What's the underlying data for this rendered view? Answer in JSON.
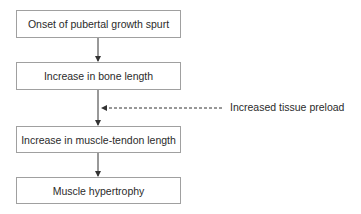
{
  "diagram": {
    "type": "flowchart",
    "nodes": [
      {
        "id": "onset",
        "label": "Onset of pubertal growth spurt"
      },
      {
        "id": "bone",
        "label": "Increase in bone length"
      },
      {
        "id": "muscle_tendon",
        "label": "Increase in muscle-tendon length"
      },
      {
        "id": "hypertrophy",
        "label": "Muscle hypertrophy"
      }
    ],
    "edges": [
      {
        "from": "onset",
        "to": "bone",
        "style": "solid"
      },
      {
        "from": "bone",
        "to": "muscle_tendon",
        "style": "solid"
      },
      {
        "from": "muscle_tendon",
        "to": "hypertrophy",
        "style": "solid"
      }
    ],
    "annotation": {
      "label": "Increased tissue preload",
      "style": "dashed",
      "points_to": "edge bone -> muscle_tendon"
    },
    "colors": {
      "text": "#2b2b2b",
      "box_border": "#a0a0a0",
      "arrow": "#333333"
    }
  }
}
